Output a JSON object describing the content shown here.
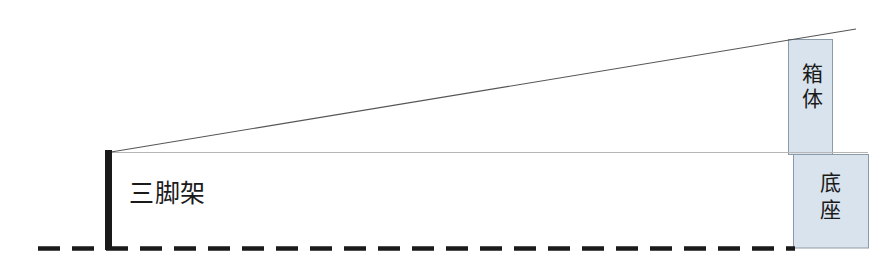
{
  "diagram": {
    "canvas": {
      "width": 893,
      "height": 274,
      "background": "#ffffff"
    },
    "colors": {
      "box_fill": "#d9e3ed",
      "box_stroke": "#8b9aa8",
      "tripod": "#1a1a1a",
      "sight_line": "#555555",
      "horizontal_line": "#b6b6b6",
      "ground_line": "#1a1a1a",
      "label_text": "#1a1a1a"
    },
    "labels": {
      "tripod": "三脚架",
      "box_body": "箱体",
      "base": "底座"
    },
    "elements": {
      "tripod": {
        "name": "tripod",
        "x": 105,
        "y": 150,
        "width": 7,
        "height": 100
      },
      "box_body": {
        "name": "box-body",
        "x": 788,
        "y": 39,
        "width": 45,
        "height": 115
      },
      "base": {
        "name": "base",
        "x": 793,
        "y": 154,
        "width": 76,
        "height": 94
      },
      "ground_line": {
        "name": "ground-line",
        "x1": 38,
        "y1": 248,
        "x2": 793,
        "y2": 248,
        "dash": "22 12",
        "width": 4
      },
      "horizontal_line": {
        "name": "horizontal-reference-line",
        "x1": 111,
        "y1": 152,
        "x2": 868,
        "y2": 152,
        "width": 1
      },
      "sight_line": {
        "name": "sight-line",
        "x1": 111,
        "y1": 152,
        "x2": 855,
        "y2": 30,
        "width": 1
      }
    }
  }
}
